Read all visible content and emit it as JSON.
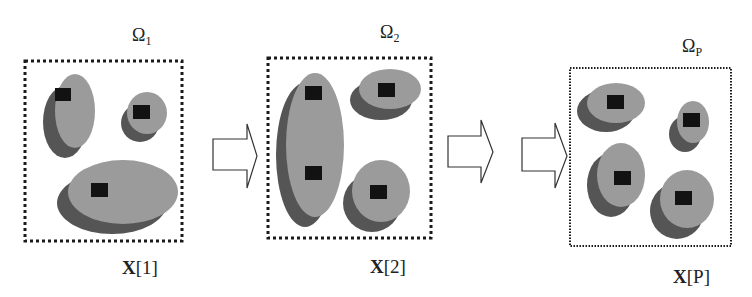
{
  "colors": {
    "blob_light": "#9b9b9b",
    "blob_shadow": "#555555",
    "center_square": "#121212",
    "frame_border": "#1a1a1a",
    "arrow_stroke": "#333333",
    "text": "#222222"
  },
  "frames": [
    {
      "domain_label": "Ω",
      "domain_subscript": "1",
      "signal_label_bold": "X",
      "signal_label_index": "[1]",
      "box": {
        "x": 25,
        "y": 61,
        "w": 157,
        "h": 180,
        "dash": "3 3",
        "stroke_width": 3
      },
      "omega_pos": {
        "x": 132,
        "y": 41
      },
      "xlabel_pos": {
        "x": 122,
        "y": 274
      },
      "blobs": [
        {
          "light": {
            "cx": 75,
            "cy": 111,
            "rx": 20,
            "ry": 37
          },
          "shadow": {
            "cx": 65,
            "cy": 122,
            "rx": 22,
            "ry": 36
          },
          "squares": [
            {
              "x": 55,
              "y": 88,
              "w": 16,
              "h": 13
            }
          ]
        },
        {
          "light": {
            "cx": 147,
            "cy": 113,
            "rx": 20,
            "ry": 21
          },
          "shadow": {
            "cx": 140,
            "cy": 123,
            "rx": 19,
            "ry": 19
          },
          "squares": [
            {
              "x": 133,
              "y": 105,
              "w": 17,
              "h": 14
            }
          ]
        },
        {
          "light": {
            "cx": 123,
            "cy": 192,
            "rx": 55,
            "ry": 32
          },
          "shadow": {
            "cx": 112,
            "cy": 203,
            "rx": 55,
            "ry": 31
          },
          "squares": [
            {
              "x": 91,
              "y": 183,
              "w": 17,
              "h": 14
            }
          ]
        }
      ]
    },
    {
      "domain_label": "Ω",
      "domain_subscript": "2",
      "signal_label_bold": "X",
      "signal_label_index": "[2]",
      "box": {
        "x": 268,
        "y": 58,
        "w": 163,
        "h": 180,
        "dash": "3 3",
        "stroke_width": 3
      },
      "omega_pos": {
        "x": 380,
        "y": 38
      },
      "xlabel_pos": {
        "x": 370,
        "y": 273
      },
      "blobs": [
        {
          "light": {
            "cx": 315,
            "cy": 145,
            "rx": 29,
            "ry": 72
          },
          "shadow": {
            "cx": 305,
            "cy": 155,
            "rx": 29,
            "ry": 72
          },
          "squares": [
            {
              "x": 305,
              "y": 86,
              "w": 17,
              "h": 14
            },
            {
              "x": 305,
              "y": 166,
              "w": 17,
              "h": 14
            }
          ]
        },
        {
          "light": {
            "cx": 390,
            "cy": 89,
            "rx": 31,
            "ry": 20
          },
          "shadow": {
            "cx": 381,
            "cy": 100,
            "rx": 31,
            "ry": 20
          },
          "squares": [
            {
              "x": 378,
              "y": 83,
              "w": 17,
              "h": 14
            }
          ]
        },
        {
          "light": {
            "cx": 381,
            "cy": 191,
            "rx": 29,
            "ry": 31
          },
          "shadow": {
            "cx": 372,
            "cy": 203,
            "rx": 29,
            "ry": 29
          },
          "squares": [
            {
              "x": 370,
              "y": 185,
              "w": 17,
              "h": 14
            }
          ]
        }
      ]
    },
    {
      "domain_label": "Ω",
      "domain_subscript": "P",
      "signal_label_bold": "X",
      "signal_label_index": "[P]",
      "box": {
        "x": 570,
        "y": 68,
        "w": 161,
        "h": 178,
        "dash": "1.5 1.5",
        "stroke_width": 2
      },
      "omega_pos": {
        "x": 682,
        "y": 52
      },
      "xlabel_pos": {
        "x": 673,
        "y": 283
      },
      "blobs": [
        {
          "light": {
            "cx": 616,
            "cy": 103,
            "rx": 29,
            "ry": 20
          },
          "shadow": {
            "cx": 606,
            "cy": 111,
            "rx": 29,
            "ry": 21
          },
          "squares": [
            {
              "x": 607,
              "y": 95,
              "w": 17,
              "h": 14
            }
          ]
        },
        {
          "light": {
            "cx": 693,
            "cy": 122,
            "rx": 16,
            "ry": 21
          },
          "shadow": {
            "cx": 685,
            "cy": 134,
            "rx": 16,
            "ry": 18
          },
          "squares": [
            {
              "x": 683,
              "y": 113,
              "w": 17,
              "h": 14
            }
          ]
        },
        {
          "light": {
            "cx": 621,
            "cy": 175,
            "rx": 24,
            "ry": 32
          },
          "shadow": {
            "cx": 611,
            "cy": 185,
            "rx": 24,
            "ry": 32
          },
          "squares": [
            {
              "x": 614,
              "y": 171,
              "w": 17,
              "h": 14
            }
          ]
        },
        {
          "light": {
            "cx": 687,
            "cy": 199,
            "rx": 27,
            "ry": 29
          },
          "shadow": {
            "cx": 677,
            "cy": 211,
            "rx": 27,
            "ry": 28
          },
          "squares": [
            {
              "x": 675,
              "y": 191,
              "w": 17,
              "h": 14
            }
          ]
        }
      ]
    }
  ],
  "arrows": [
    {
      "body_x0": 213,
      "body_x1": 247,
      "body_y0": 139,
      "body_y1": 170,
      "head_y0": 124,
      "head_y1": 188,
      "tip_x": 257,
      "tip_y": 156
    },
    {
      "body_x0": 448,
      "body_x1": 481,
      "body_y0": 136,
      "body_y1": 167,
      "head_y0": 120,
      "head_y1": 183,
      "tip_x": 493,
      "tip_y": 152
    },
    {
      "body_x0": 522,
      "body_x1": 555,
      "body_y0": 138,
      "body_y1": 171,
      "head_y0": 123,
      "head_y1": 188,
      "tip_x": 567,
      "tip_y": 156
    }
  ]
}
